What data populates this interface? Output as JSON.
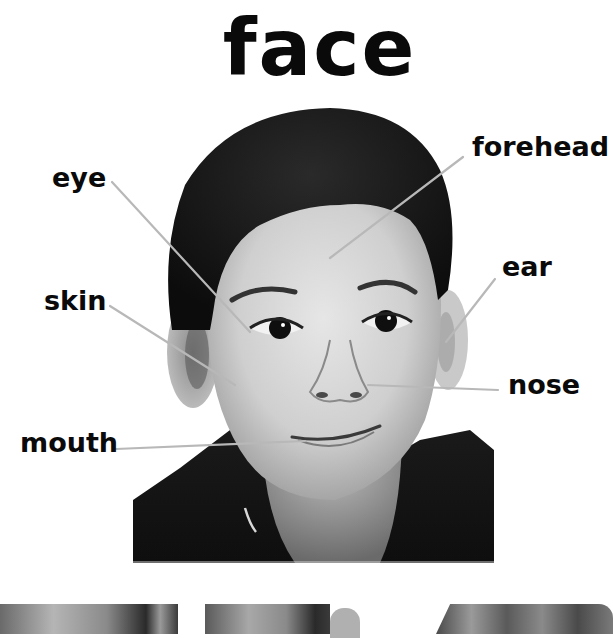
{
  "page": {
    "title": "face",
    "background": "#ffffff",
    "text_color": "#0a0a0a",
    "leader_line_color": "#b8b8b8"
  },
  "photo": {
    "subject": "smiling boy, black and white portrait",
    "style": "grayscale"
  },
  "labels": [
    {
      "id": "eye",
      "text": "eye"
    },
    {
      "id": "forehead",
      "text": "forehead"
    },
    {
      "id": "skin",
      "text": "skin"
    },
    {
      "id": "ear",
      "text": "ear"
    },
    {
      "id": "nose",
      "text": "nose"
    },
    {
      "id": "mouth",
      "text": "mouth"
    }
  ],
  "thumbnails": [
    {
      "id": "thumb-1",
      "description": "grayscale photo of a face (cropped)"
    },
    {
      "id": "thumb-2",
      "description": "grayscale photo of a face with ear (cropped)"
    },
    {
      "id": "thumb-3",
      "description": "grayscale photo of a face with hair (cropped)"
    }
  ]
}
